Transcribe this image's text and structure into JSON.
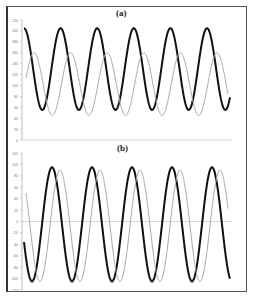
{
  "chart_data": [
    {
      "type": "line",
      "title": "(a)",
      "xlabel": "",
      "ylabel": "",
      "ylim": [
        0,
        220
      ],
      "yticks": [
        0,
        20,
        40,
        60,
        80,
        100,
        120,
        140,
        160,
        180,
        200,
        220
      ],
      "grid": false,
      "legend": "none",
      "series": [
        {
          "name": "dark",
          "color": "#111111",
          "min": 55,
          "max": 205,
          "cycles": 5.7,
          "phase_start": "near peak",
          "width": 2
        },
        {
          "name": "light",
          "color": "#aaaaaa",
          "min": 45,
          "max": 160,
          "cycles": 5.7,
          "lag_fraction": 0.27,
          "width": 1
        }
      ]
    },
    {
      "type": "line",
      "title": "(b)",
      "xlabel": "",
      "ylabel": "",
      "ylim": [
        -120,
        120
      ],
      "yticks": [
        120,
        100,
        80,
        60,
        40,
        20,
        0,
        -20,
        -40,
        -60,
        -80,
        -100,
        -120
      ],
      "grid": false,
      "zero_line": true,
      "legend": "none",
      "series": [
        {
          "name": "dark",
          "color": "#111111",
          "min": -105,
          "max": 95,
          "cycles": 5.2,
          "width": 2
        },
        {
          "name": "light",
          "color": "#aaaaaa",
          "min": -105,
          "max": 90,
          "cycles": 5.2,
          "lag_fraction": 0.2,
          "width": 1
        }
      ]
    }
  ],
  "labels": {
    "a": "(a)",
    "b": "(b)"
  }
}
